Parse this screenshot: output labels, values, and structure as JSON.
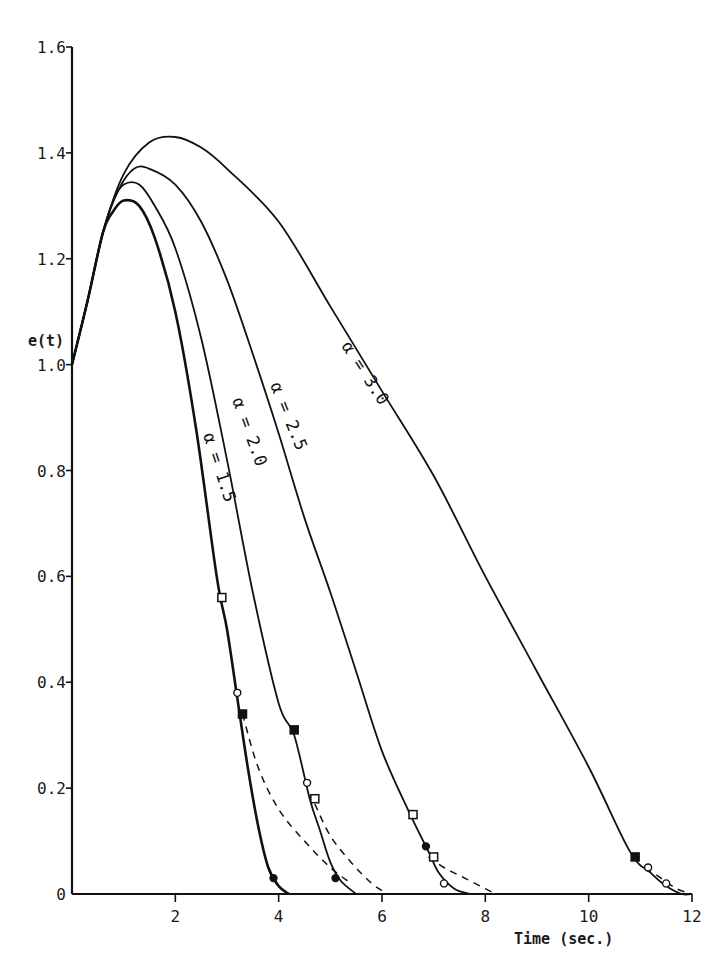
{
  "chart_data": {
    "type": "line",
    "title": "",
    "xlabel": "Time (sec.)",
    "ylabel": "e(t)",
    "xlim": [
      0,
      12
    ],
    "ylim": [
      0,
      1.6
    ],
    "grid": false,
    "legend": "none (curves labeled inline)",
    "x_ticks": [
      "2",
      "4",
      "6",
      "8",
      "10",
      "12"
    ],
    "y_ticks": [
      "0",
      "0.2",
      "0.4",
      "0.6",
      "0.8",
      "1.0",
      "1.2",
      "1.4",
      "1.6"
    ],
    "series": [
      {
        "name": "α = 1.5",
        "label": "α = 1.5",
        "x": [
          0,
          0.3,
          0.6,
          0.8,
          1.0,
          1.3,
          1.6,
          2.0,
          2.4,
          2.8,
          3.0,
          3.2,
          3.4,
          3.6,
          3.8,
          4.0,
          4.2
        ],
        "values": [
          1.0,
          1.12,
          1.25,
          1.29,
          1.31,
          1.3,
          1.24,
          1.1,
          0.88,
          0.6,
          0.5,
          0.37,
          0.24,
          0.13,
          0.05,
          0.015,
          0.0
        ],
        "dashed_tail": {
          "x": [
            3.3,
            3.6,
            4.0,
            4.5,
            5.0,
            5.4
          ],
          "values": [
            0.34,
            0.24,
            0.16,
            0.1,
            0.05,
            0.02
          ]
        }
      },
      {
        "name": "α = 2.0",
        "label": "α = 2.0",
        "x": [
          0,
          0.3,
          0.6,
          0.8,
          1.0,
          1.3,
          1.6,
          2.0,
          2.5,
          3.0,
          3.5,
          4.0,
          4.3,
          4.6,
          4.8,
          5.0,
          5.2,
          5.5
        ],
        "values": [
          1.0,
          1.12,
          1.25,
          1.31,
          1.34,
          1.34,
          1.3,
          1.22,
          1.05,
          0.82,
          0.57,
          0.36,
          0.3,
          0.18,
          0.12,
          0.06,
          0.025,
          0.0
        ],
        "dashed_tail": {
          "x": [
            4.7,
            5.0,
            5.4,
            5.8,
            6.1
          ],
          "values": [
            0.17,
            0.11,
            0.06,
            0.02,
            0.0
          ]
        }
      },
      {
        "name": "α = 2.5",
        "label": "α = 2.5",
        "x": [
          0,
          0.3,
          0.6,
          0.9,
          1.2,
          1.5,
          2.0,
          2.5,
          3.0,
          3.5,
          4.0,
          4.5,
          5.0,
          5.5,
          6.0,
          6.5,
          6.9,
          7.1,
          7.4,
          7.7
        ],
        "values": [
          1.0,
          1.12,
          1.25,
          1.33,
          1.37,
          1.37,
          1.34,
          1.27,
          1.16,
          1.02,
          0.87,
          0.71,
          0.57,
          0.42,
          0.27,
          0.16,
          0.08,
          0.04,
          0.01,
          0.0
        ],
        "dashed_tail": {
          "x": [
            6.9,
            7.2,
            7.6,
            8.0,
            8.2
          ],
          "values": [
            0.07,
            0.05,
            0.03,
            0.01,
            0.0
          ]
        }
      },
      {
        "name": "α = 3.0",
        "label": "α = 3.0",
        "x": [
          0,
          0.3,
          0.6,
          1.0,
          1.5,
          2.0,
          2.5,
          3.0,
          4.0,
          5.0,
          6.0,
          7.0,
          8.0,
          9.0,
          10.0,
          10.8,
          11.2,
          11.5,
          11.8,
          12.0
        ],
        "values": [
          1.0,
          1.12,
          1.25,
          1.36,
          1.42,
          1.43,
          1.41,
          1.37,
          1.27,
          1.11,
          0.95,
          0.79,
          0.6,
          0.42,
          0.24,
          0.08,
          0.04,
          0.015,
          0.0,
          0.0
        ],
        "dashed_tail": {
          "x": [
            11.1,
            11.4,
            11.7,
            12.0
          ],
          "values": [
            0.05,
            0.03,
            0.01,
            0.0
          ]
        }
      }
    ],
    "markers": [
      {
        "series": "α = 1.5",
        "x": 2.9,
        "y": 0.56,
        "shape": "open-square"
      },
      {
        "series": "α = 1.5",
        "x": 3.2,
        "y": 0.38,
        "shape": "open-circle"
      },
      {
        "series": "α = 1.5",
        "x": 3.3,
        "y": 0.34,
        "shape": "filled-square"
      },
      {
        "series": "α = 1.5",
        "x": 3.9,
        "y": 0.03,
        "shape": "filled-circle"
      },
      {
        "series": "α = 2.0",
        "x": 4.3,
        "y": 0.31,
        "shape": "filled-square"
      },
      {
        "series": "α = 2.0",
        "x": 4.55,
        "y": 0.21,
        "shape": "open-circle"
      },
      {
        "series": "α = 2.0",
        "x": 4.7,
        "y": 0.18,
        "shape": "open-square"
      },
      {
        "series": "α = 2.0",
        "x": 5.1,
        "y": 0.03,
        "shape": "filled-circle"
      },
      {
        "series": "α = 2.5",
        "x": 6.6,
        "y": 0.15,
        "shape": "open-square"
      },
      {
        "series": "α = 2.5",
        "x": 6.85,
        "y": 0.09,
        "shape": "filled-circle"
      },
      {
        "series": "α = 2.5",
        "x": 7.0,
        "y": 0.07,
        "shape": "open-square"
      },
      {
        "series": "α = 2.5",
        "x": 7.2,
        "y": 0.02,
        "shape": "open-circle"
      },
      {
        "series": "α = 3.0",
        "x": 10.9,
        "y": 0.07,
        "shape": "filled-square"
      },
      {
        "series": "α = 3.0",
        "x": 11.15,
        "y": 0.05,
        "shape": "open-circle"
      },
      {
        "series": "α = 3.0",
        "x": 11.5,
        "y": 0.02,
        "shape": "open-circle"
      }
    ]
  },
  "labels": {
    "y_axis_title": "e(t)",
    "x_axis_title": "Time (sec.)",
    "curve_a15": "α = 1.5",
    "curve_a20": "α = 2.0",
    "curve_a25": "α = 2.5",
    "curve_a30": "α = 3.0"
  },
  "style": {
    "ink": "#111111",
    "background": "#ffffff"
  }
}
